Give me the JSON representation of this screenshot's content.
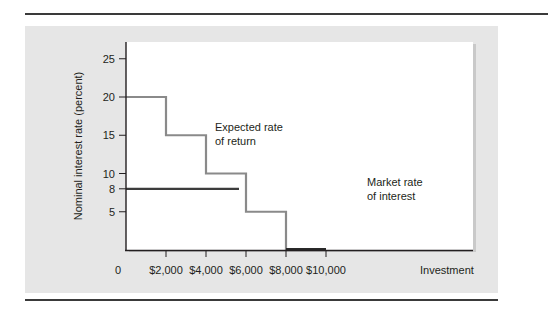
{
  "chart_data": {
    "type": "line",
    "title": "",
    "xlabel": "Investment",
    "ylabel": "Nominal interest rate (percent)",
    "xlim": [
      0,
      10000
    ],
    "ylim": [
      0,
      27
    ],
    "grid": false,
    "x_ticks": [
      {
        "value": 0,
        "label": "0"
      },
      {
        "value": 2000,
        "label": "$2,000"
      },
      {
        "value": 4000,
        "label": "$4,000"
      },
      {
        "value": 6000,
        "label": "$6,000"
      },
      {
        "value": 8000,
        "label": "$8,000"
      },
      {
        "value": 10000,
        "label": "$10,000"
      }
    ],
    "y_ticks": [
      {
        "value": 5,
        "label": "5"
      },
      {
        "value": 8,
        "label": "8"
      },
      {
        "value": 10,
        "label": "10"
      },
      {
        "value": 15,
        "label": "15"
      },
      {
        "value": 20,
        "label": "20"
      },
      {
        "value": 25,
        "label": "25"
      }
    ],
    "series": [
      {
        "name": "Expected rate of return",
        "style": "step",
        "color": "#8a8a8a",
        "x": [
          0,
          2000,
          2000,
          4000,
          4000,
          6000,
          6000,
          8000,
          8000,
          10000
        ],
        "y": [
          20,
          20,
          15,
          15,
          10,
          10,
          5,
          5,
          0,
          0
        ]
      },
      {
        "name": "Market rate of interest",
        "style": "line",
        "color": "#3c3c3c",
        "x": [
          0,
          5650
        ],
        "y": [
          8,
          8
        ]
      }
    ],
    "annotations": [
      {
        "text_line1": "Expected rate",
        "text_line2": "of return"
      },
      {
        "text_line1": "Market rate",
        "text_line2": "of interest"
      }
    ],
    "legend": "none (inline annotations)"
  },
  "colors": {
    "panel": "#e6e6e6",
    "plot_bg": "#ffffff",
    "axis": "#231f20",
    "step_line": "#8a8a8a",
    "market_line": "#3c3c3c",
    "rule": "#3a3a3a"
  }
}
